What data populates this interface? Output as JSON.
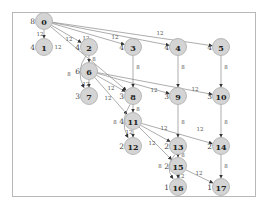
{
  "diagram": {
    "type": "directed-graph",
    "nodes": [
      {
        "id": "0",
        "x": 44,
        "y": 21,
        "side": "8"
      },
      {
        "id": "1",
        "x": 44,
        "y": 47,
        "side": "4"
      },
      {
        "id": "2",
        "x": 89,
        "y": 47,
        "side": "4"
      },
      {
        "id": "3",
        "x": 133,
        "y": 47,
        "side": "4"
      },
      {
        "id": "4",
        "x": 178,
        "y": 47,
        "side": "4"
      },
      {
        "id": "5",
        "x": 221,
        "y": 47,
        "side": "4"
      },
      {
        "id": "6",
        "x": 89,
        "y": 71,
        "side": "6"
      },
      {
        "id": "7",
        "x": 89,
        "y": 96,
        "side": "3"
      },
      {
        "id": "8",
        "x": 133,
        "y": 96,
        "side": "3"
      },
      {
        "id": "9",
        "x": 178,
        "y": 96,
        "side": "3"
      },
      {
        "id": "10",
        "x": 221,
        "y": 96,
        "side": "3"
      },
      {
        "id": "11",
        "x": 133,
        "y": 121,
        "side": "4"
      },
      {
        "id": "12",
        "x": 133,
        "y": 146,
        "side": "2"
      },
      {
        "id": "13",
        "x": 178,
        "y": 146,
        "side": "2"
      },
      {
        "id": "14",
        "x": 221,
        "y": 146,
        "side": "2"
      },
      {
        "id": "15",
        "x": 178,
        "y": 166,
        "side": "2"
      },
      {
        "id": "16",
        "x": 178,
        "y": 187,
        "side": "1"
      },
      {
        "id": "17",
        "x": 221,
        "y": 187,
        "side": "1"
      }
    ],
    "edges": [
      {
        "from": "0",
        "to": "1",
        "label": "12",
        "lx": 40,
        "ly": 34
      },
      {
        "from": "0",
        "to": "2",
        "label": "12",
        "lx": 69,
        "ly": 39
      },
      {
        "from": "0",
        "to": "3",
        "label": "12",
        "lx": 86,
        "ly": 38
      },
      {
        "from": "0",
        "to": "4",
        "label": "12",
        "lx": 115,
        "ly": 37
      },
      {
        "from": "0",
        "to": "5",
        "label": "12",
        "lx": 160,
        "ly": 33
      },
      {
        "from": "0",
        "to": "8",
        "label": "12",
        "lx": 58,
        "ly": 47
      },
      {
        "from": "2",
        "to": "6",
        "label": "8",
        "lx": 94,
        "ly": 59
      },
      {
        "from": "2",
        "to": "7",
        "label": "8",
        "lx": 69,
        "ly": 74,
        "curve": true
      },
      {
        "from": "3",
        "to": "8",
        "label": "8",
        "lx": 138,
        "ly": 67
      },
      {
        "from": "4",
        "to": "9",
        "label": "8",
        "lx": 183,
        "ly": 67
      },
      {
        "from": "5",
        "to": "10",
        "label": "8",
        "lx": 226,
        "ly": 67
      },
      {
        "from": "6",
        "to": "7",
        "label": "12",
        "lx": 86,
        "ly": 84
      },
      {
        "from": "6",
        "to": "8",
        "label": "12",
        "lx": 111,
        "ly": 88
      },
      {
        "from": "6",
        "to": "9",
        "label": "12",
        "lx": 154,
        "ly": 90
      },
      {
        "from": "6",
        "to": "10",
        "label": "12",
        "lx": 195,
        "ly": 89
      },
      {
        "from": "6",
        "to": "11",
        "label": "12",
        "lx": 108,
        "ly": 98
      },
      {
        "from": "8",
        "to": "11",
        "label": "8",
        "lx": 138,
        "ly": 109
      },
      {
        "from": "8",
        "to": "12",
        "label": "8",
        "lx": 115,
        "ly": 122,
        "curve": true
      },
      {
        "from": "9",
        "to": "13",
        "label": "8",
        "lx": 183,
        "ly": 122
      },
      {
        "from": "10",
        "to": "14",
        "label": "8",
        "lx": 226,
        "ly": 122
      },
      {
        "from": "11",
        "to": "12",
        "label": "12",
        "lx": 129,
        "ly": 132
      },
      {
        "from": "11",
        "to": "13",
        "label": "12",
        "lx": 164,
        "ly": 128
      },
      {
        "from": "11",
        "to": "14",
        "label": "12",
        "lx": 200,
        "ly": 129
      },
      {
        "from": "11",
        "to": "15",
        "label": "12",
        "lx": 152,
        "ly": 143
      },
      {
        "from": "13",
        "to": "15",
        "label": "8",
        "lx": 183,
        "ly": 155
      },
      {
        "from": "13",
        "to": "16",
        "label": "8",
        "lx": 160,
        "ly": 166,
        "curve": true
      },
      {
        "from": "14",
        "to": "17",
        "label": "8",
        "lx": 226,
        "ly": 166
      },
      {
        "from": "15",
        "to": "16",
        "label": "12",
        "lx": 181,
        "ly": 176
      },
      {
        "from": "15",
        "to": "17",
        "label": "12",
        "lx": 199,
        "ly": 173
      }
    ]
  }
}
